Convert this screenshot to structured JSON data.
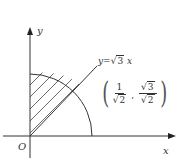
{
  "figure": {
    "axes": {
      "x_label": "x",
      "y_label": "y",
      "origin_label": "O"
    },
    "line": {
      "equation_prefix": "y=",
      "equation_radicand": "3",
      "equation_var": "x"
    },
    "point": {
      "x_num": "1",
      "x_den_radicand": "2",
      "y_num_radicand": "3",
      "y_den_radicand": "2",
      "separator": ","
    },
    "shapes": {
      "arc": "quarter-circle centered at origin",
      "shaded_region": "sector between y-axis and line y=√3x, hatched"
    }
  }
}
